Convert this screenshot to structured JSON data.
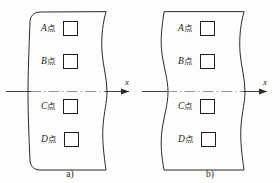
{
  "figure": {
    "type": "engineering-cross-section-diagram",
    "panel_count": 2,
    "stroke_color": "#2b2b2b",
    "centerline_color": "#8a8a8a",
    "background_color": "#fdfdfc",
    "panels": [
      {
        "id": "a",
        "caption": "a)",
        "axis_label": "x",
        "points": [
          {
            "latin": "A",
            "cjk": "点",
            "box_value": ""
          },
          {
            "latin": "B",
            "cjk": "点",
            "box_value": ""
          },
          {
            "latin": "C",
            "cjk": "点",
            "box_value": ""
          },
          {
            "latin": "D",
            "cjk": "点",
            "box_value": ""
          }
        ]
      },
      {
        "id": "b",
        "caption": "b)",
        "axis_label": "x",
        "points": [
          {
            "latin": "A",
            "cjk": "点",
            "box_value": ""
          },
          {
            "latin": "B",
            "cjk": "点",
            "box_value": ""
          },
          {
            "latin": "C",
            "cjk": "点",
            "box_value": ""
          },
          {
            "latin": "D",
            "cjk": "点",
            "box_value": ""
          }
        ]
      }
    ]
  }
}
